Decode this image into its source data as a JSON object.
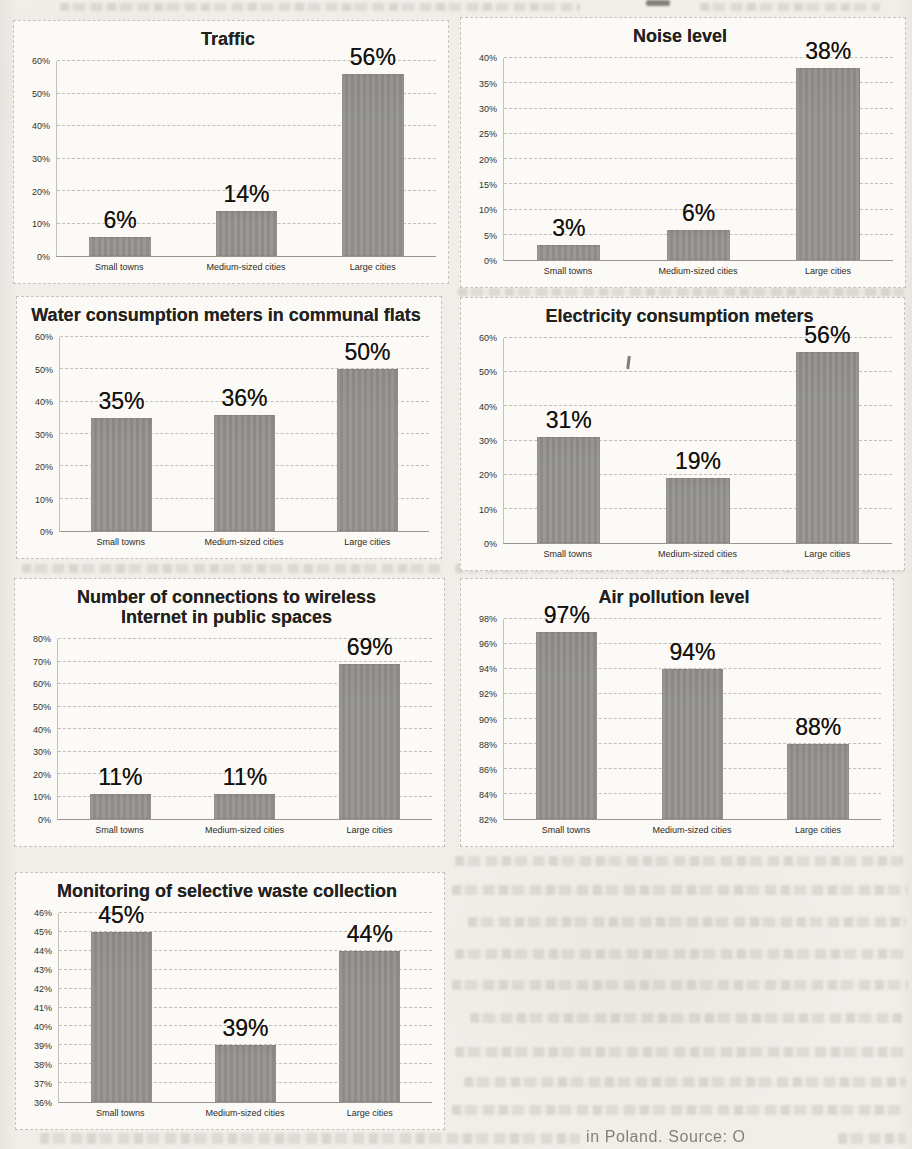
{
  "document": {
    "footer_caption_fragment": "in Poland. Source: O"
  },
  "colors": {
    "bar": "#969491",
    "page_background": "#f0eee9",
    "chart_background": "#fbfaf7",
    "title_text": "#23211c",
    "value_label_text": "#14120e",
    "gridline": "#8c867a"
  },
  "chart_data": [
    {
      "type": "bar",
      "title": "Traffic",
      "categories": [
        "Small towns",
        "Medium-sized cities",
        "Large cities"
      ],
      "values": [
        6,
        14,
        56
      ],
      "value_labels": [
        "6%",
        "14%",
        "56%"
      ],
      "unit": "%",
      "xlabel": "",
      "ylabel": "",
      "ylim": [
        0,
        60
      ],
      "ytick_step": 10,
      "grid": true,
      "legend": false
    },
    {
      "type": "bar",
      "title": "Noise level",
      "categories": [
        "Small towns",
        "Medium-sized cities",
        "Large cities"
      ],
      "values": [
        3,
        6,
        38
      ],
      "value_labels": [
        "3%",
        "6%",
        "38%"
      ],
      "unit": "%",
      "xlabel": "",
      "ylabel": "",
      "ylim": [
        0,
        40
      ],
      "ytick_step": 5,
      "grid": true,
      "legend": false
    },
    {
      "type": "bar",
      "title": "Water consumption meters in communal flats",
      "categories": [
        "Small towns",
        "Medium-sized cities",
        "Large cities"
      ],
      "values": [
        35,
        36,
        50
      ],
      "value_labels": [
        "35%",
        "36%",
        "50%"
      ],
      "unit": "%",
      "xlabel": "",
      "ylabel": "",
      "ylim": [
        0,
        60
      ],
      "ytick_step": 10,
      "grid": true,
      "legend": false
    },
    {
      "type": "bar",
      "title": "Electricity consumption meters",
      "categories": [
        "Small towns",
        "Medium-sized cities",
        "Large cities"
      ],
      "values": [
        31,
        19,
        56
      ],
      "value_labels": [
        "31%",
        "19%",
        "56%"
      ],
      "unit": "%",
      "xlabel": "",
      "ylabel": "",
      "ylim": [
        0,
        60
      ],
      "ytick_step": 10,
      "grid": true,
      "legend": false
    },
    {
      "type": "bar",
      "title": "Number of connections to wireless Internet in public spaces",
      "categories": [
        "Small towns",
        "Medium-sized cities",
        "Large cities"
      ],
      "values": [
        11,
        11,
        69
      ],
      "value_labels": [
        "11%",
        "11%",
        "69%"
      ],
      "unit": "%",
      "xlabel": "",
      "ylabel": "",
      "ylim": [
        0,
        80
      ],
      "ytick_step": 10,
      "grid": true,
      "legend": false
    },
    {
      "type": "bar",
      "title": "Air pollution level",
      "categories": [
        "Small towns",
        "Medium-sized cities",
        "Large cities"
      ],
      "values": [
        97,
        94,
        88
      ],
      "value_labels": [
        "97%",
        "94%",
        "88%"
      ],
      "unit": "%",
      "xlabel": "",
      "ylabel": "",
      "ylim": [
        82,
        98
      ],
      "ytick_step": 2,
      "grid": true,
      "legend": false
    },
    {
      "type": "bar",
      "title": "Monitoring of selective waste collection",
      "categories": [
        "Small towns",
        "Medium-sized cities",
        "Large cities"
      ],
      "values": [
        45,
        39,
        44
      ],
      "value_labels": [
        "45%",
        "39%",
        "44%"
      ],
      "unit": "%",
      "xlabel": "",
      "ylabel": "",
      "ylim": [
        36,
        46
      ],
      "ytick_step": 1,
      "grid": true,
      "legend": false
    }
  ]
}
